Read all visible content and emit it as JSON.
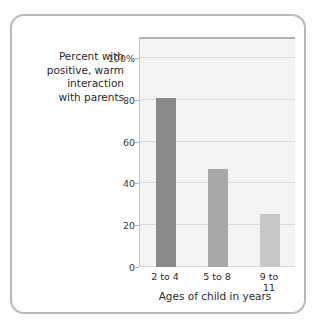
{
  "chart_data": {
    "type": "bar",
    "title": "",
    "categories": [
      "2 to 4",
      "5 to 8",
      "9 to 11"
    ],
    "values": [
      81,
      47,
      25.5
    ],
    "series": [
      {
        "name": "Percent with positive, warm interaction with parents",
        "values": [
          81,
          47,
          25.5
        ]
      }
    ],
    "xlabel": "Ages of child in years",
    "ylabel": "Percent with positive, warm interaction with parents",
    "ylim": [
      0,
      110
    ],
    "yticks": [
      0,
      20,
      40,
      60,
      80,
      100
    ],
    "ytick_labels": [
      "0",
      "20",
      "40",
      "60",
      "80",
      "100%"
    ],
    "grid": true,
    "legend": "none",
    "bar_colors": [
      "#8a8a8a",
      "#a8a8a8",
      "#c8c8c8"
    ]
  },
  "axes": {
    "y_caption": "Percent with\npositive, warm\ninteraction\nwith parents",
    "x_title": "Ages of child in years"
  },
  "colors": {
    "frame_border": "#b8b8b8",
    "plot_background": "#f4f4f4",
    "gridline": "#d9d9d9",
    "plot_top_border": "#b0b0b0",
    "text": "#2b2b2b"
  }
}
